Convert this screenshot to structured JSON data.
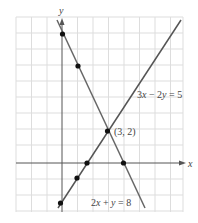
{
  "diagram": {
    "axes": {
      "x_label": "x",
      "y_label": "y"
    },
    "grid": {
      "x_min": -3,
      "x_max": 8,
      "y_min": -3,
      "y_max": 9
    },
    "lines": [
      {
        "equation": "3x − 2y = 5",
        "points": [
          [
            0,
            -2.5
          ],
          [
            1,
            -1
          ],
          [
            2,
            0.5
          ],
          [
            3,
            2
          ]
        ]
      },
      {
        "equation": "2x + y = 8",
        "points": [
          [
            0,
            8
          ],
          [
            1,
            6
          ],
          [
            4,
            0
          ],
          [
            3,
            2
          ]
        ]
      }
    ],
    "intersection": {
      "label": "(3, 2)",
      "x": 3,
      "y": 2
    },
    "labels": {
      "line1": "3x − 2y = 5",
      "line2": "2x + y = 8",
      "intersection": "(3, 2)"
    }
  }
}
